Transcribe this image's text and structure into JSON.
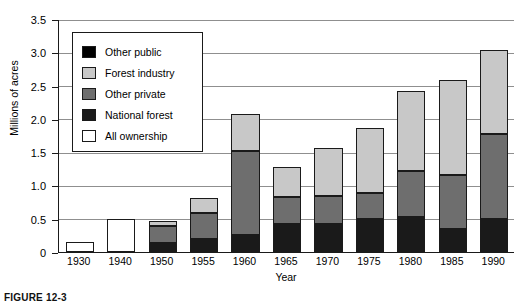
{
  "chart_data": {
    "type": "bar",
    "subtype": "stacked-bar",
    "title": "",
    "xlabel": "Year",
    "ylabel": "Millions of acres",
    "ylim": [
      0,
      3.5
    ],
    "yticks": [
      "0",
      "0.5",
      "1.0",
      "1.5",
      "2.0",
      "2.5",
      "3.0",
      "3.5"
    ],
    "ytick_values": [
      0,
      0.5,
      1.0,
      1.5,
      2.0,
      2.5,
      3.0,
      3.5
    ],
    "grid": "horizontal",
    "legend_position": "upper-left-inside",
    "categories": [
      "1930",
      "1940",
      "1950",
      "1955",
      "1960",
      "1965",
      "1970",
      "1975",
      "1980",
      "1985",
      "1990"
    ],
    "series": [
      {
        "name": "National forest",
        "color": "#1a1a1a",
        "values": [
          0,
          0,
          0.17,
          0.22,
          0.28,
          0.45,
          0.45,
          0.52,
          0.55,
          0.38,
          0.52
        ]
      },
      {
        "name": "Other private",
        "color": "#6e6e6e",
        "values": [
          0,
          0,
          0.25,
          0.4,
          1.27,
          0.4,
          0.42,
          0.4,
          0.7,
          0.8,
          1.28
        ]
      },
      {
        "name": "Forest industry",
        "color": "#c8c8c8",
        "values": [
          0,
          0,
          0.08,
          0.22,
          0.55,
          0.45,
          0.73,
          0.98,
          1.2,
          1.44,
          1.27
        ]
      },
      {
        "name": "All ownership",
        "color": "#ffffff",
        "values": [
          0.15,
          0.5,
          0,
          0,
          0,
          0,
          0,
          0,
          0,
          0,
          0
        ]
      },
      {
        "name": "Other public",
        "color": "#000000",
        "values": [
          0,
          0,
          0,
          0,
          0,
          0,
          0,
          0,
          0,
          0,
          0
        ]
      }
    ],
    "totals": [
      0.15,
      0.5,
      0.5,
      0.84,
      2.1,
      1.3,
      1.6,
      1.9,
      2.45,
      2.62,
      3.07
    ],
    "legend": [
      {
        "label": "Other public",
        "color": "#000000"
      },
      {
        "label": "Forest industry",
        "color": "#c8c8c8"
      },
      {
        "label": "Other private",
        "color": "#6e6e6e"
      },
      {
        "label": "National forest",
        "color": "#1a1a1a"
      },
      {
        "label": "All ownership",
        "color": "#ffffff"
      }
    ]
  },
  "caption": {
    "text": "FIGURE 12-3"
  }
}
